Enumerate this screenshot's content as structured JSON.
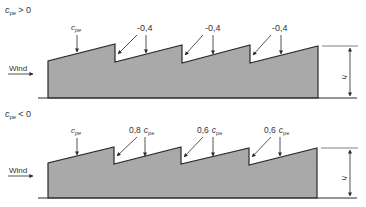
{
  "colors": {
    "fill": "#a9a9a9",
    "stroke": "#2a2a2a",
    "text": "#333333"
  },
  "diagrams": [
    {
      "condition": {
        "symbol": "c",
        "subscript": "pe",
        "relation": "> 0"
      },
      "wind_label": "Wind",
      "height_label": "h",
      "roof_labels": [
        {
          "prefix": "",
          "symbol": "c",
          "subscript": "pe"
        },
        {
          "prefix": "-0,4",
          "symbol": "",
          "subscript": ""
        },
        {
          "prefix": "-0,4",
          "symbol": "",
          "subscript": ""
        },
        {
          "prefix": "-0,4",
          "symbol": "",
          "subscript": ""
        }
      ]
    },
    {
      "condition": {
        "symbol": "c",
        "subscript": "pe",
        "relation": "< 0"
      },
      "wind_label": "Wind",
      "height_label": "h",
      "roof_labels": [
        {
          "prefix": "",
          "symbol": "c",
          "subscript": "pe"
        },
        {
          "prefix": "0,8",
          "symbol": "c",
          "subscript": "pe"
        },
        {
          "prefix": "0,6",
          "symbol": "c",
          "subscript": "pe"
        },
        {
          "prefix": "0,6",
          "symbol": "c",
          "subscript": "pe"
        }
      ]
    }
  ]
}
